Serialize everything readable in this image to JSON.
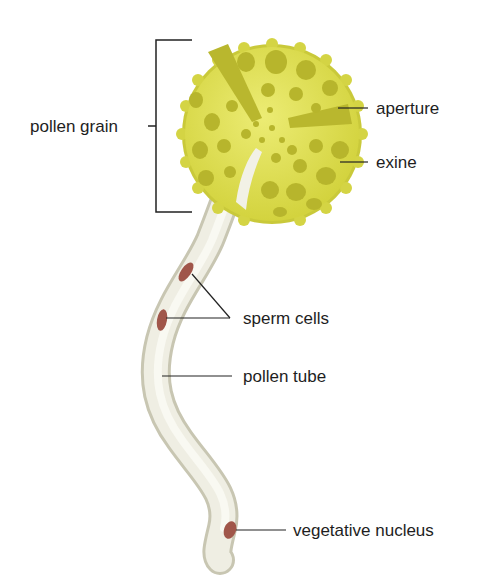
{
  "labels": {
    "pollen_grain": "pollen grain",
    "aperture": "aperture",
    "exine": "exine",
    "sperm_cells": "sperm cells",
    "pollen_tube": "pollen tube",
    "vegetative_nucleus": "vegetative nucleus"
  },
  "colors": {
    "grain_fill": "#dede4e",
    "grain_pit": "#b7b52c",
    "grain_edge": "#c9c93a",
    "tube_fill": "#ecebde",
    "tube_shade": "#c8c6b2",
    "nucleus": "#a0564a",
    "line": "#222222"
  }
}
